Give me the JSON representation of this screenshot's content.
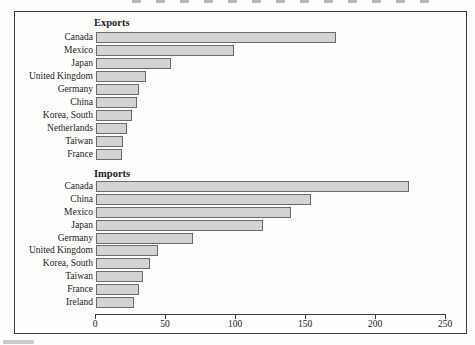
{
  "figure": {
    "axis_ticks": [
      0,
      50,
      100,
      150,
      200,
      250
    ]
  },
  "chart_data": [
    {
      "type": "bar",
      "orientation": "horizontal",
      "title": "Exports",
      "categories": [
        "Canada",
        "Mexico",
        "Japan",
        "United Kingdom",
        "Germany",
        "China",
        "Korea, South",
        "Netherlands",
        "Taiwan",
        "France"
      ],
      "values": [
        170,
        97,
        52,
        34,
        29,
        28,
        24,
        21,
        18,
        17
      ],
      "xlabel": "",
      "ylabel": "",
      "xlim": [
        0,
        250
      ],
      "x_ticks": [
        0,
        50,
        100,
        150,
        200,
        250
      ],
      "grid": false,
      "legend": "none"
    },
    {
      "type": "bar",
      "orientation": "horizontal",
      "title": "Imports",
      "categories": [
        "Canada",
        "China",
        "Mexico",
        "Japan",
        "Germany",
        "United Kingdom",
        "Korea, South",
        "Taiwan",
        "France",
        "Ireland"
      ],
      "values": [
        222,
        152,
        138,
        118,
        68,
        43,
        37,
        32,
        29,
        26
      ],
      "xlabel": "",
      "ylabel": "",
      "xlim": [
        0,
        250
      ],
      "x_ticks": [
        0,
        50,
        100,
        150,
        200,
        250
      ],
      "grid": false,
      "legend": "none"
    }
  ],
  "colors": {
    "bar_fill": "#d3d3d3",
    "bar_border": "#6b6b6b",
    "frame_border": "#3d3d3d",
    "background": "#fdfdfc"
  }
}
